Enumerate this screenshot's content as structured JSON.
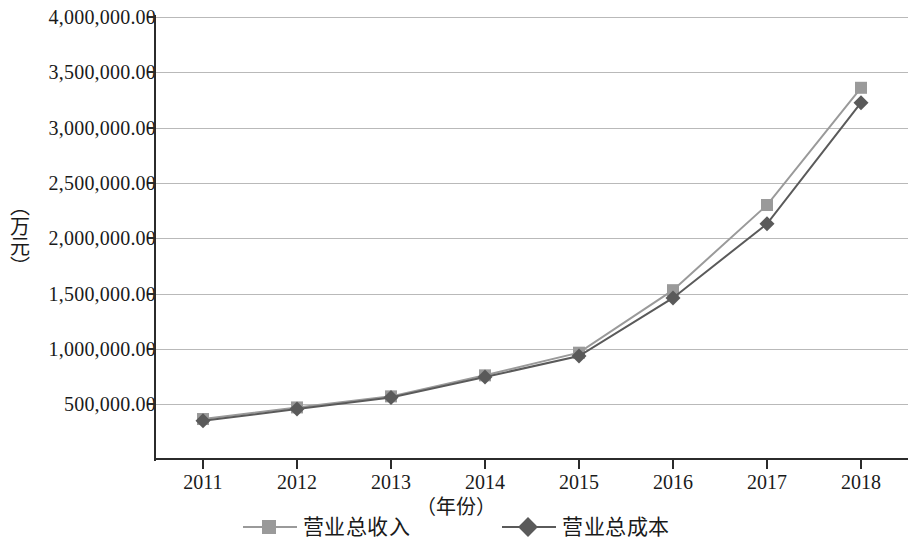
{
  "chart_data": {
    "type": "line",
    "title": "",
    "subtitle": "",
    "xlabel": "（年份）",
    "ylabel": "（万元）",
    "categories": [
      "2011",
      "2012",
      "2013",
      "2014",
      "2015",
      "2016",
      "2017",
      "2018"
    ],
    "ylim": [
      0,
      4000000
    ],
    "ytick_labels": [
      "4,000,000.00",
      "3,500,000.00",
      "3,000,000.00",
      "2,500,000.00",
      "2,000,000.00",
      "1,500,000.00",
      "1,000,000.00",
      "500,000.00"
    ],
    "ytick_values": [
      4000000,
      3500000,
      3000000,
      2500000,
      2000000,
      1500000,
      1000000,
      500000
    ],
    "grid": true,
    "legend_position": "bottom",
    "series": [
      {
        "name": "营业总收入",
        "marker": "square",
        "color": "#9a9a9a",
        "values": [
          365000,
          470000,
          570000,
          760000,
          965000,
          1530000,
          2300000,
          3360000
        ]
      },
      {
        "name": "营业总成本",
        "marker": "diamond",
        "color": "#5a5a5a",
        "values": [
          350000,
          455000,
          560000,
          745000,
          935000,
          1460000,
          2130000,
          3225000
        ]
      }
    ]
  },
  "axis": {
    "y_label": "（万元）",
    "x_label": "（年份）"
  },
  "legend": {
    "items": [
      {
        "label": "营业总收入",
        "marker": "square-marker",
        "color": "#9a9a9a"
      },
      {
        "label": "营业总成本",
        "marker": "diamond-marker",
        "color": "#5a5a5a"
      }
    ]
  },
  "colors": {
    "series_1": "#9a9a9a",
    "series_2": "#5a5a5a",
    "axis": "#2b2b2b",
    "grid": "#b9b9b9",
    "background": "#ffffff"
  }
}
